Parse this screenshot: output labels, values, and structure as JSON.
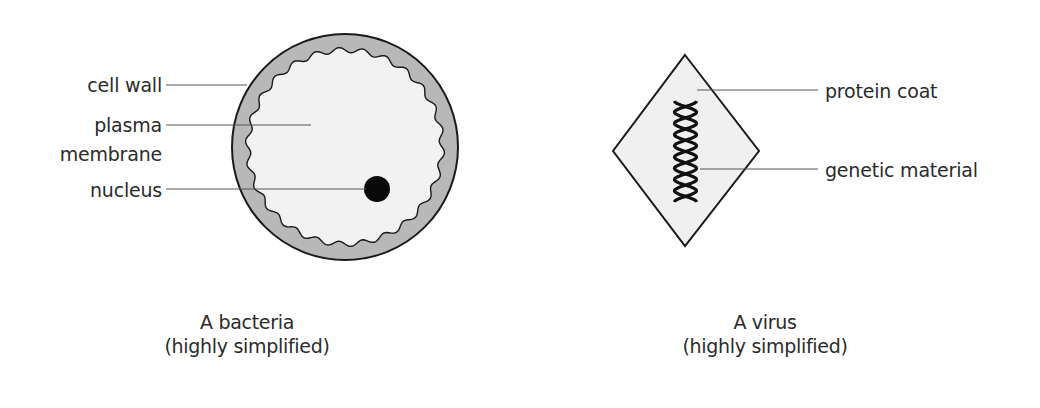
{
  "diagram": {
    "colors": {
      "background": "#ffffff",
      "outline": "#1a1a1a",
      "cell_wall_fill": "#b8b8b8",
      "cytoplasm_fill": "#f2f2f2",
      "nucleus_fill": "#0a0a0a",
      "capsid_fill": "#f0f0f0",
      "leader_line": "#555555",
      "text": "#2b2b2b"
    },
    "bacteria": {
      "labels": {
        "cell_wall": "cell wall",
        "plasma_line1": "plasma",
        "plasma_line2": "membrane",
        "nucleus": "nucleus"
      },
      "caption": {
        "line1": "A bacteria",
        "line2": "(highly simplified)"
      }
    },
    "virus": {
      "labels": {
        "protein_coat": "protein coat",
        "genetic_material": "genetic material"
      },
      "caption": {
        "line1": "A virus",
        "line2": "(highly simplified)"
      }
    }
  }
}
